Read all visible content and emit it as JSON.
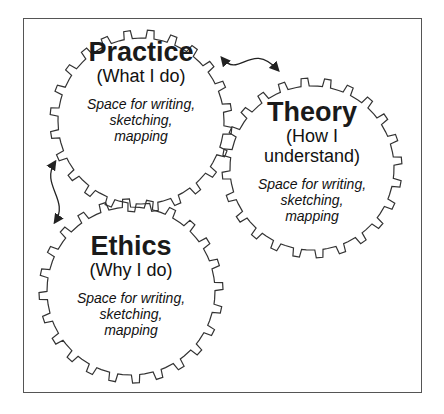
{
  "diagram": {
    "type": "three interlocking gears",
    "stroke_color": "#333333",
    "gears": [
      {
        "id": "practice",
        "title": "Practice",
        "subtitle": [
          "(What I do)"
        ],
        "note": [
          "Space for writing,",
          "sketching,",
          "mapping"
        ],
        "cx": 141,
        "cy": 121,
        "r_outer": 91,
        "r_inner": 83,
        "teeth": 24,
        "phase": 0,
        "text_top": 38
      },
      {
        "id": "theory",
        "title": "Theory",
        "subtitle": [
          "(How I",
          "understand)"
        ],
        "note": [
          "Space for writing,",
          "sketching,",
          "mapping"
        ],
        "cx": 312,
        "cy": 168,
        "r_outer": 90,
        "r_inner": 82,
        "teeth": 24,
        "phase": 0.07,
        "text_top": 98
      },
      {
        "id": "ethics",
        "title": "Ethics",
        "subtitle": [
          "(Why I do)"
        ],
        "note": [
          "Space for writing,",
          "sketching,",
          "mapping"
        ],
        "cx": 131,
        "cy": 291,
        "r_outer": 92,
        "r_inner": 84,
        "teeth": 24,
        "phase": 0.1,
        "text_top": 232
      }
    ],
    "arrows": [
      {
        "id": "practice-theory",
        "from": [
          222,
          58
        ],
        "to": [
          278,
          70
        ],
        "ctrl1": [
          240,
          80
        ],
        "ctrl2": [
          250,
          40
        ]
      },
      {
        "id": "practice-ethics",
        "from": [
          55,
          162
        ],
        "to": [
          55,
          222
        ],
        "ctrl1": [
          40,
          185
        ],
        "ctrl2": [
          70,
          200
        ]
      }
    ]
  }
}
